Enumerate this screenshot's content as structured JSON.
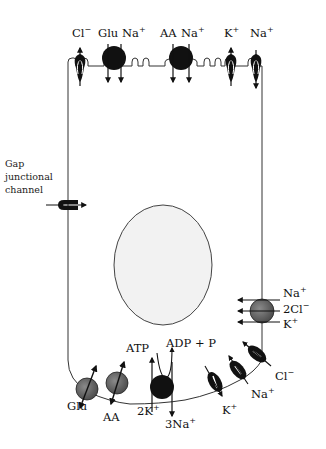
{
  "diagram": {
    "type": "cell transport schematic",
    "colors": {
      "membrane": "#333333",
      "transporter_black": "#111111",
      "transporter_gray": "#6e6e6e",
      "nucleus_fill": "#f2f2f2",
      "background": "#ffffff"
    },
    "apical": {
      "labels": {
        "cl": "Cl",
        "cl_sup": "−",
        "glu": "Glu",
        "na1": "Na",
        "na1_sup": "+",
        "aa": "AA",
        "na2": "Na",
        "na2_sup": "+",
        "k": "K",
        "k_sup": "+",
        "na3": "Na",
        "na3_sup": "+"
      }
    },
    "gap_junction": {
      "label_line1": "Gap",
      "label_line2": "junctional",
      "label_line3": "channel"
    },
    "basolateral_right": {
      "na": "Na",
      "na_sup": "+",
      "cl": "2Cl",
      "cl_sup": "−",
      "k": "K",
      "k_sup": "+"
    },
    "basal": {
      "glu": "Glu",
      "aa": "AA",
      "atp": "ATP",
      "adp": "ADP + P",
      "k2": "2K",
      "k2_sup": "+",
      "na3": "3Na",
      "na3_sup": "+",
      "k": "K",
      "k_sup": "+",
      "na": "Na",
      "na_sup": "+",
      "cl": "Cl",
      "cl_sup": "−"
    }
  }
}
